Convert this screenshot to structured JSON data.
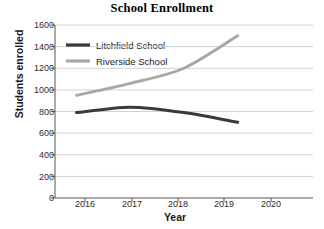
{
  "chart_data": {
    "type": "line",
    "title": "School Enrollment",
    "xlabel": "Year",
    "ylabel": "Students enrolled",
    "x": [
      2016,
      2017,
      2018,
      2019,
      2020
    ],
    "xtick_labels": [
      "2016",
      "2017",
      "2018",
      "2019",
      "2020"
    ],
    "xlim": [
      2015.6,
      2020.4
    ],
    "ylim": [
      0,
      1600
    ],
    "ytick_labels": [
      "0",
      "200",
      "400",
      "600",
      "800",
      "1000",
      "1200",
      "1400",
      "1600"
    ],
    "yticks": [
      0,
      200,
      400,
      600,
      800,
      1000,
      1200,
      1400,
      1600
    ],
    "grid": true,
    "grid_axis": "y",
    "legend_position": "upper left inside",
    "series": [
      {
        "name": "Litchfield School",
        "color": "#3a3a3a",
        "x": [
          2016,
          2017,
          2018,
          2019
        ],
        "values": [
          790,
          840,
          790,
          700
        ]
      },
      {
        "name": "Riverside School",
        "color": "#a8a8a8",
        "x": [
          2016,
          2017,
          2018,
          2019
        ],
        "values": [
          950,
          1060,
          1200,
          1500
        ]
      }
    ]
  },
  "legend": {
    "items": [
      {
        "label": "Litchfield School"
      },
      {
        "label": "Riverside School"
      }
    ]
  },
  "axes": {
    "axis_color": "#555555",
    "grid_color": "#d2d2d2"
  }
}
